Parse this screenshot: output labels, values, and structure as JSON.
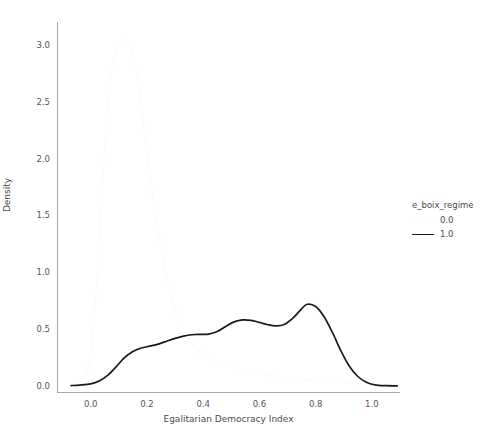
{
  "chart_data": {
    "type": "line",
    "title": "",
    "subtitle": "",
    "xlabel": "Egalitarian Democracy Index",
    "ylabel": "Density",
    "xlim": [
      -0.12,
      1.1
    ],
    "ylim": [
      -0.06,
      3.2
    ],
    "xticks": [
      "0.0",
      "0.2",
      "0.4",
      "0.6",
      "0.8",
      "1.0"
    ],
    "xtick_values": [
      0.0,
      0.2,
      0.4,
      0.6,
      0.8,
      1.0
    ],
    "yticks": [
      "0.0",
      "0.5",
      "1.0",
      "1.5",
      "2.0",
      "2.5",
      "3.0"
    ],
    "ytick_values": [
      0.0,
      0.5,
      1.0,
      1.5,
      2.0,
      2.5,
      3.0
    ],
    "grid": false,
    "legend_position": "right",
    "legend_title": "e_boix_regime",
    "series": [
      {
        "name": "0.0",
        "color": "#fbfbfb",
        "x": [
          -0.06,
          -0.02,
          0.0,
          0.02,
          0.04,
          0.06,
          0.08,
          0.1,
          0.12,
          0.14,
          0.16,
          0.18,
          0.2,
          0.24,
          0.28,
          0.32,
          0.36,
          0.4,
          0.46,
          0.52,
          0.6,
          0.7,
          0.8,
          0.9,
          1.0
        ],
        "y": [
          0.02,
          0.1,
          0.3,
          0.85,
          1.7,
          2.45,
          2.85,
          2.98,
          3.05,
          3.0,
          2.8,
          2.45,
          2.05,
          1.35,
          0.85,
          0.55,
          0.38,
          0.28,
          0.2,
          0.15,
          0.11,
          0.07,
          0.05,
          0.03,
          0.01
        ]
      },
      {
        "name": "1.0",
        "color": "#1a1a1a",
        "x": [
          -0.07,
          -0.04,
          0.0,
          0.03,
          0.06,
          0.09,
          0.12,
          0.15,
          0.18,
          0.21,
          0.24,
          0.27,
          0.3,
          0.33,
          0.36,
          0.39,
          0.42,
          0.45,
          0.48,
          0.51,
          0.54,
          0.57,
          0.6,
          0.63,
          0.66,
          0.69,
          0.72,
          0.75,
          0.77,
          0.8,
          0.83,
          0.86,
          0.89,
          0.92,
          0.95,
          0.98,
          1.01,
          1.05,
          1.09
        ],
        "y": [
          0.005,
          0.01,
          0.02,
          0.045,
          0.095,
          0.17,
          0.25,
          0.305,
          0.335,
          0.352,
          0.37,
          0.395,
          0.42,
          0.44,
          0.452,
          0.455,
          0.458,
          0.48,
          0.525,
          0.565,
          0.582,
          0.578,
          0.56,
          0.54,
          0.53,
          0.545,
          0.6,
          0.68,
          0.72,
          0.7,
          0.61,
          0.47,
          0.31,
          0.175,
          0.085,
          0.035,
          0.012,
          0.004,
          0.002
        ]
      }
    ]
  },
  "legend": {
    "title": "e_boix_regime",
    "entries": [
      {
        "label": "0.0",
        "color": "#fbfbfb"
      },
      {
        "label": "1.0",
        "color": "#1a1a1a"
      }
    ]
  },
  "axes": {
    "x_title": "Egalitarian Democracy Index",
    "y_title": "Density",
    "x_tick_labels": [
      "0.0",
      "0.2",
      "0.4",
      "0.6",
      "0.8",
      "1.0"
    ],
    "y_tick_labels": [
      "0.0",
      "0.5",
      "1.0",
      "1.5",
      "2.0",
      "2.5",
      "3.0"
    ]
  },
  "colors": {
    "axis": "#a6a6a6",
    "text": "#4a4a4a",
    "background": "#ffffff",
    "series_0": "#fbfbfb",
    "series_1": "#1a1a1a"
  }
}
